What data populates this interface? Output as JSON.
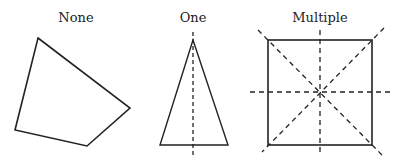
{
  "panels": [
    {
      "label": "None",
      "shape": "irregular-quadrilateral",
      "symmetry_lines": 0
    },
    {
      "label": "One",
      "shape": "isosceles-triangle",
      "symmetry_lines": 1
    },
    {
      "label": "Multiple",
      "shape": "square",
      "symmetry_lines": 4
    }
  ]
}
